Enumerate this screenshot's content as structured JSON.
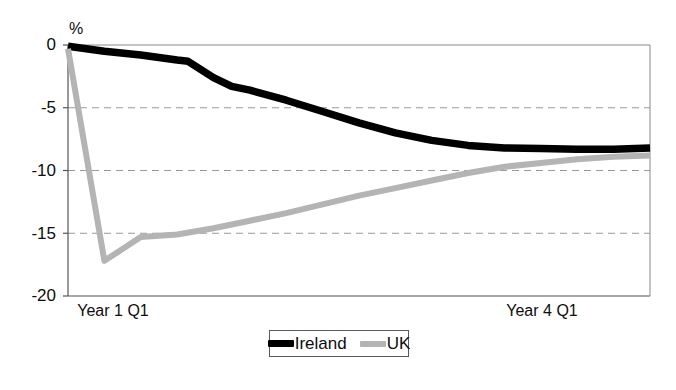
{
  "chart_data": {
    "type": "line",
    "title": "",
    "subtitle": "",
    "xlabel": "",
    "ylabel": "%",
    "unit_label": "%",
    "ylim": [
      -20,
      0
    ],
    "xlim": [
      0,
      16
    ],
    "grid": true,
    "grid_style": "dashed",
    "grid_color": "#999999",
    "legend_position": "bottom-center",
    "yticks": [
      0,
      -5,
      -10,
      -15,
      -20
    ],
    "ytick_labels": [
      "0",
      "-5",
      "-10",
      "-15",
      "-20"
    ],
    "xtick_labels": [
      "Year 1 Q1",
      "Year 4 Q1"
    ],
    "xtick_positions": [
      0,
      12
    ],
    "series": [
      {
        "name": "Ireland",
        "color": "#000000",
        "x": [
          0,
          1,
          2,
          3,
          3.3,
          4,
          4.5,
          5,
          6,
          7,
          8,
          9,
          10,
          11,
          12,
          13,
          14,
          15,
          16
        ],
        "values": [
          -0.1,
          -0.5,
          -0.8,
          -1.2,
          -1.3,
          -2.6,
          -3.3,
          -3.6,
          -4.4,
          -5.3,
          -6.2,
          -7.0,
          -7.6,
          -8.0,
          -8.2,
          -8.25,
          -8.3,
          -8.3,
          -8.2
        ]
      },
      {
        "name": "UK",
        "color": "#b4b4b4",
        "x": [
          0,
          1,
          2,
          3,
          4,
          5,
          6,
          7,
          8,
          9,
          10,
          11,
          12,
          13,
          14,
          15,
          16
        ],
        "values": [
          -0.3,
          -17.2,
          -15.3,
          -15.1,
          -14.6,
          -14.0,
          -13.4,
          -12.7,
          -12.0,
          -11.4,
          -10.8,
          -10.2,
          -9.7,
          -9.4,
          -9.1,
          -8.9,
          -8.8
        ]
      }
    ]
  },
  "legend": {
    "entries": [
      {
        "label": "Ireland",
        "color": "#000000"
      },
      {
        "label": "UK",
        "color": "#b4b4b4"
      }
    ]
  },
  "axes": {
    "unit_label": "%",
    "ytick_labels": [
      "0",
      "-5",
      "-10",
      "-15",
      "-20"
    ],
    "xtick_left": "Year 1 Q1",
    "xtick_right": "Year 4 Q1"
  }
}
